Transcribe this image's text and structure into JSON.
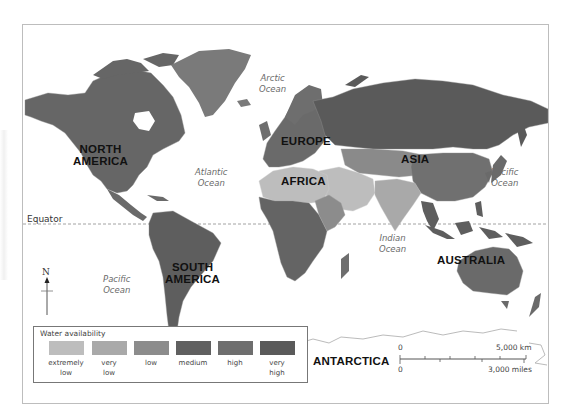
{
  "map": {
    "title": "Water availability world map",
    "continents": [
      {
        "name": "NORTH AMERICA",
        "line1": "NORTH",
        "line2": "AMERICA"
      },
      {
        "name": "SOUTH AMERICA",
        "line1": "SOUTH",
        "line2": "AMERICA"
      },
      {
        "name": "EUROPE"
      },
      {
        "name": "AFRICA"
      },
      {
        "name": "ASIA"
      },
      {
        "name": "AUSTRALIA"
      },
      {
        "name": "ANTARCTICA"
      }
    ],
    "oceans": {
      "arctic": {
        "line1": "Arctic",
        "line2": "Ocean"
      },
      "atlantic": {
        "line1": "Atlantic",
        "line2": "Ocean"
      },
      "pacific_east": {
        "line1": "Pacific",
        "line2": "Ocean"
      },
      "pacific_west": {
        "line1": "Pacific",
        "line2": "Ocean"
      },
      "indian": {
        "line1": "Indian",
        "line2": "Ocean"
      }
    },
    "equator_label": "Equator",
    "compass_label": "N",
    "scale": {
      "zero_top": "0",
      "zero_bottom": "0",
      "km_label": "5,000 km",
      "miles_label": "3,000 miles"
    }
  },
  "legend": {
    "title": "Water availability",
    "items": [
      {
        "line1": "extremely",
        "line2": "low",
        "color": "#bdbdbd"
      },
      {
        "line1": "very",
        "line2": "low",
        "color": "#a9a9a9"
      },
      {
        "line1": "low",
        "line2": "",
        "color": "#8c8c8c"
      },
      {
        "line1": "medium",
        "line2": "",
        "color": "#606060"
      },
      {
        "line1": "high",
        "line2": "",
        "color": "#6e6e6e"
      },
      {
        "line1": "very",
        "line2": "high",
        "color": "#5a5a5a"
      }
    ]
  },
  "colors": {
    "extremely_low": "#bdbdbd",
    "very_low": "#a9a9a9",
    "low": "#8c8c8c",
    "medium": "#606060",
    "high": "#6e6e6e",
    "very_high": "#5a5a5a",
    "frame": "#bdbdbd",
    "border_lines": "#9a9a9a"
  }
}
